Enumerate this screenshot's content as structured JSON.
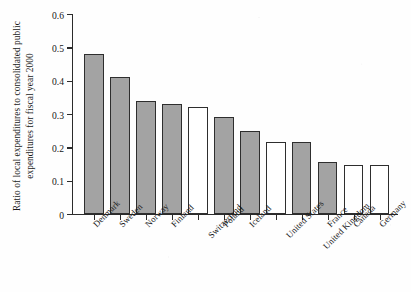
{
  "chart_data": {
    "type": "bar",
    "title": "",
    "xlabel": "",
    "ylabel_line1": "Ratio of local expenditures to consolidated public",
    "ylabel_line2": "expenditures for fiscal year 2000",
    "ylim": [
      0,
      0.6
    ],
    "yticks": [
      "0",
      "0.1",
      "0.2",
      "0.3",
      "0.4",
      "0.5",
      "0.6"
    ],
    "ytick_values": [
      0,
      0.1,
      0.2,
      0.3,
      0.4,
      0.5,
      0.6
    ],
    "grid": false,
    "legend": "none",
    "categories": [
      "Denmark",
      "Sweden",
      "Norway",
      "Finland",
      "Switzerland",
      "Poland",
      "Iceland",
      "United States",
      "United Kingdom",
      "France",
      "Canada",
      "Germany"
    ],
    "values": [
      0.48,
      0.41,
      0.34,
      0.33,
      0.32,
      0.29,
      0.25,
      0.215,
      0.215,
      0.155,
      0.148,
      0.148
    ],
    "bar_styles": [
      "filled",
      "filled",
      "filled",
      "filled",
      "open",
      "filled",
      "filled",
      "open",
      "filled",
      "filled",
      "open",
      "open"
    ],
    "label_rows": [
      0,
      0,
      0,
      0,
      1,
      0,
      0,
      1,
      2,
      0,
      0,
      0
    ],
    "colors": {
      "filled": "#a3a3a3",
      "open": "#ffffff",
      "outline": "#2e2e2e",
      "axis": "#2b2b2b",
      "background": "#fefefe"
    }
  }
}
